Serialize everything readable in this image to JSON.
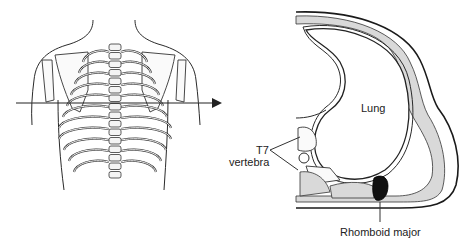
{
  "figure": {
    "left_panel": {
      "subject": "posterior view of thorax with skeleton",
      "arrow": "horizontal section plane arrow"
    },
    "right_panel": {
      "subject": "transverse section of thorax at T7 level",
      "labels": {
        "lung": "Lung",
        "t7_line1": "T7",
        "t7_line2": "vertebra",
        "rhomboid": "Rhomboid major"
      }
    }
  }
}
